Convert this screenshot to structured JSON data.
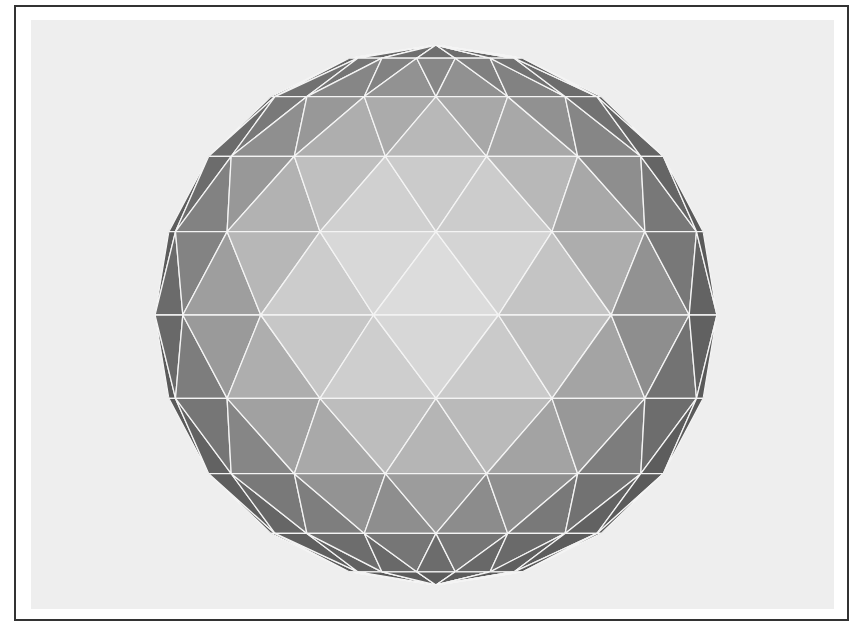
{
  "scene": {
    "subject": "geodesic sphere",
    "render": "flat-shaded triangulated sphere with white wireframe edges",
    "center": [
      436,
      315
    ],
    "radius_x": 281,
    "radius_y": 270,
    "rows": 10,
    "colors": {
      "frame_border": "#333333",
      "frame_background": "#ffffff",
      "canvas_background": "#eeeeee",
      "edge_line": "#f4f4f4",
      "face_light": "#dcdcdc",
      "face_dark": "#5e5e5e"
    }
  }
}
